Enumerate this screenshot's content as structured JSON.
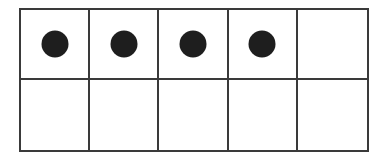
{
  "ten_frame": {
    "rows": 2,
    "columns": 5,
    "filled_count": 4,
    "cells": [
      {
        "row": 0,
        "col": 0,
        "filled": true
      },
      {
        "row": 0,
        "col": 1,
        "filled": true
      },
      {
        "row": 0,
        "col": 2,
        "filled": true
      },
      {
        "row": 0,
        "col": 3,
        "filled": true
      },
      {
        "row": 0,
        "col": 4,
        "filled": false
      },
      {
        "row": 1,
        "col": 0,
        "filled": false
      },
      {
        "row": 1,
        "col": 1,
        "filled": false
      },
      {
        "row": 1,
        "col": 2,
        "filled": false
      },
      {
        "row": 1,
        "col": 3,
        "filled": false
      },
      {
        "row": 1,
        "col": 4,
        "filled": false
      }
    ],
    "colors": {
      "grid_line": "#3a3a3a",
      "counter": "#1e1e1e",
      "background": "#ffffff"
    }
  }
}
